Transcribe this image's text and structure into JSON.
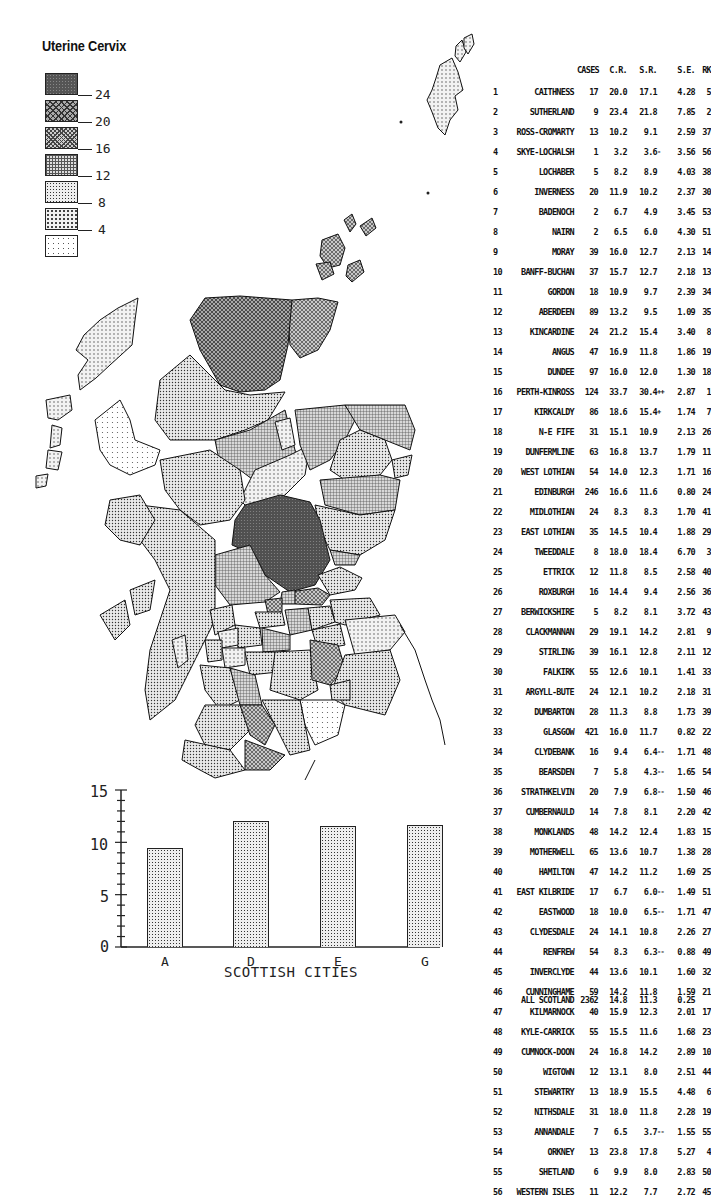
{
  "title": "Uterine Cervix",
  "legend": {
    "thresholds": [
      "24",
      "20",
      "16",
      "12",
      "8",
      "4"
    ],
    "classes": 7
  },
  "table": {
    "headers": {
      "cases": "CASES",
      "cr": "C.R.",
      "sr": "S.R.",
      "se": "S.E.",
      "rk": "RK"
    },
    "rows": [
      {
        "num": "1",
        "name": "CAITHNESS",
        "cases": "17",
        "cr": "20.0",
        "sr": "17.1",
        "flag": "",
        "se": "4.28",
        "rk": "5"
      },
      {
        "num": "2",
        "name": "SUTHERLAND",
        "cases": "9",
        "cr": "23.4",
        "sr": "21.8",
        "flag": "",
        "se": "7.85",
        "rk": "2"
      },
      {
        "num": "3",
        "name": "ROSS-CROMARTY",
        "cases": "13",
        "cr": "10.2",
        "sr": "9.1",
        "flag": "",
        "se": "2.59",
        "rk": "37"
      },
      {
        "num": "4",
        "name": "SKYE-LOCHALSH",
        "cases": "1",
        "cr": "3.2",
        "sr": "3.6",
        "flag": "-",
        "se": "3.56",
        "rk": "56"
      },
      {
        "num": "5",
        "name": "LOCHABER",
        "cases": "5",
        "cr": "8.2",
        "sr": "8.9",
        "flag": "",
        "se": "4.03",
        "rk": "38"
      },
      {
        "num": "6",
        "name": "INVERNESS",
        "cases": "20",
        "cr": "11.9",
        "sr": "10.2",
        "flag": "",
        "se": "2.37",
        "rk": "30"
      },
      {
        "num": "7",
        "name": "BADENOCH",
        "cases": "2",
        "cr": "6.7",
        "sr": "4.9",
        "flag": "",
        "se": "3.45",
        "rk": "53"
      },
      {
        "num": "8",
        "name": "NAIRN",
        "cases": "2",
        "cr": "6.5",
        "sr": "6.0",
        "flag": "",
        "se": "4.30",
        "rk": "51"
      },
      {
        "num": "9",
        "name": "MORAY",
        "cases": "39",
        "cr": "16.0",
        "sr": "12.7",
        "flag": "",
        "se": "2.13",
        "rk": "14"
      },
      {
        "num": "10",
        "name": "BANFF-BUCHAN",
        "cases": "37",
        "cr": "15.7",
        "sr": "12.7",
        "flag": "",
        "se": "2.18",
        "rk": "13"
      },
      {
        "num": "11",
        "name": "GORDON",
        "cases": "18",
        "cr": "10.9",
        "sr": "9.7",
        "flag": "",
        "se": "2.39",
        "rk": "34"
      },
      {
        "num": "12",
        "name": "ABERDEEN",
        "cases": "89",
        "cr": "13.2",
        "sr": "9.5",
        "flag": "",
        "se": "1.09",
        "rk": "35"
      },
      {
        "num": "13",
        "name": "KINCARDINE",
        "cases": "24",
        "cr": "21.2",
        "sr": "15.4",
        "flag": "",
        "se": "3.40",
        "rk": "8"
      },
      {
        "num": "14",
        "name": "ANGUS",
        "cases": "47",
        "cr": "16.9",
        "sr": "11.8",
        "flag": "",
        "se": "1.86",
        "rk": "19"
      },
      {
        "num": "15",
        "name": "DUNDEE",
        "cases": "97",
        "cr": "16.0",
        "sr": "12.0",
        "flag": "",
        "se": "1.30",
        "rk": "18"
      },
      {
        "num": "16",
        "name": "PERTH-KINROSS",
        "cases": "124",
        "cr": "33.7",
        "sr": "30.4",
        "flag": "++",
        "se": "2.87",
        "rk": "1"
      },
      {
        "num": "17",
        "name": "KIRKCALDY",
        "cases": "86",
        "cr": "18.6",
        "sr": "15.4",
        "flag": "+",
        "se": "1.74",
        "rk": "7"
      },
      {
        "num": "18",
        "name": "N-E FIFE",
        "cases": "31",
        "cr": "15.1",
        "sr": "10.9",
        "flag": "",
        "se": "2.13",
        "rk": "26"
      },
      {
        "num": "19",
        "name": "DUNFERMLINE",
        "cases": "63",
        "cr": "16.8",
        "sr": "13.7",
        "flag": "",
        "se": "1.79",
        "rk": "11"
      },
      {
        "num": "20",
        "name": "WEST LOTHIAN",
        "cases": "54",
        "cr": "14.0",
        "sr": "12.3",
        "flag": "",
        "se": "1.71",
        "rk": "16"
      },
      {
        "num": "21",
        "name": "EDINBURGH",
        "cases": "246",
        "cr": "16.6",
        "sr": "11.6",
        "flag": "",
        "se": "0.80",
        "rk": "24"
      },
      {
        "num": "22",
        "name": "MIDLOTHIAN",
        "cases": "24",
        "cr": "8.3",
        "sr": "8.3",
        "flag": "",
        "se": "1.70",
        "rk": "41"
      },
      {
        "num": "23",
        "name": "EAST LOTHIAN",
        "cases": "35",
        "cr": "14.5",
        "sr": "10.4",
        "flag": "",
        "se": "1.88",
        "rk": "29"
      },
      {
        "num": "24",
        "name": "TWEEDDALE",
        "cases": "8",
        "cr": "18.0",
        "sr": "18.4",
        "flag": "",
        "se": "6.70",
        "rk": "3"
      },
      {
        "num": "25",
        "name": "ETTRICK",
        "cases": "12",
        "cr": "11.8",
        "sr": "8.5",
        "flag": "",
        "se": "2.58",
        "rk": "40"
      },
      {
        "num": "26",
        "name": "ROXBURGH",
        "cases": "16",
        "cr": "14.4",
        "sr": "9.4",
        "flag": "",
        "se": "2.56",
        "rk": "36"
      },
      {
        "num": "27",
        "name": "BERWICKSHIRE",
        "cases": "5",
        "cr": "8.2",
        "sr": "8.1",
        "flag": "",
        "se": "3.72",
        "rk": "43"
      },
      {
        "num": "28",
        "name": "CLACKMANNAN",
        "cases": "29",
        "cr": "19.1",
        "sr": "14.2",
        "flag": "",
        "se": "2.81",
        "rk": "9"
      },
      {
        "num": "29",
        "name": "STIRLING",
        "cases": "39",
        "cr": "16.1",
        "sr": "12.8",
        "flag": "",
        "se": "2.11",
        "rk": "12"
      },
      {
        "num": "30",
        "name": "FALKIRK",
        "cases": "55",
        "cr": "12.6",
        "sr": "10.1",
        "flag": "",
        "se": "1.41",
        "rk": "33"
      },
      {
        "num": "31",
        "name": "ARGYLL-BUTE",
        "cases": "24",
        "cr": "12.1",
        "sr": "10.2",
        "flag": "",
        "se": "2.18",
        "rk": "31"
      },
      {
        "num": "32",
        "name": "DUMBARTON",
        "cases": "28",
        "cr": "11.3",
        "sr": "8.8",
        "flag": "",
        "se": "1.73",
        "rk": "39"
      },
      {
        "num": "33",
        "name": "GLASGOW",
        "cases": "421",
        "cr": "16.0",
        "sr": "11.7",
        "flag": "",
        "se": "0.82",
        "rk": "22"
      },
      {
        "num": "34",
        "name": "CLYDEBANK",
        "cases": "16",
        "cr": "9.4",
        "sr": "6.4",
        "flag": "--",
        "se": "1.71",
        "rk": "48"
      },
      {
        "num": "35",
        "name": "BEARSDEN",
        "cases": "7",
        "cr": "5.8",
        "sr": "4.3",
        "flag": "--",
        "se": "1.65",
        "rk": "54"
      },
      {
        "num": "36",
        "name": "STRATHKELVIN",
        "cases": "20",
        "cr": "7.9",
        "sr": "6.8",
        "flag": "--",
        "se": "1.50",
        "rk": "46"
      },
      {
        "num": "37",
        "name": "CUMBERNAULD",
        "cases": "14",
        "cr": "7.8",
        "sr": "8.1",
        "flag": "",
        "se": "2.20",
        "rk": "42"
      },
      {
        "num": "38",
        "name": "MONKLANDS",
        "cases": "48",
        "cr": "14.2",
        "sr": "12.4",
        "flag": "",
        "se": "1.83",
        "rk": "15"
      },
      {
        "num": "39",
        "name": "MOTHERWELL",
        "cases": "65",
        "cr": "13.6",
        "sr": "10.7",
        "flag": "",
        "se": "1.38",
        "rk": "28"
      },
      {
        "num": "40",
        "name": "HAMILTON",
        "cases": "47",
        "cr": "14.2",
        "sr": "11.2",
        "flag": "",
        "se": "1.69",
        "rk": "25"
      },
      {
        "num": "41",
        "name": "EAST KILBRIDE",
        "cases": "17",
        "cr": "6.7",
        "sr": "6.0",
        "flag": "--",
        "se": "1.49",
        "rk": "51"
      },
      {
        "num": "42",
        "name": "EASTWOOD",
        "cases": "18",
        "cr": "10.0",
        "sr": "6.5",
        "flag": "--",
        "se": "1.71",
        "rk": "47"
      },
      {
        "num": "43",
        "name": "CLYDESDALE",
        "cases": "24",
        "cr": "14.1",
        "sr": "10.8",
        "flag": "",
        "se": "2.26",
        "rk": "27"
      },
      {
        "num": "44",
        "name": "RENFREW",
        "cases": "54",
        "cr": "8.3",
        "sr": "6.3",
        "flag": "--",
        "se": "0.88",
        "rk": "49"
      },
      {
        "num": "45",
        "name": "INVERCLYDE",
        "cases": "44",
        "cr": "13.6",
        "sr": "10.1",
        "flag": "",
        "se": "1.60",
        "rk": "32"
      },
      {
        "num": "46",
        "name": "CUNNINGHAME",
        "cases": "59",
        "cr": "14.2",
        "sr": "11.8",
        "flag": "",
        "se": "1.59",
        "rk": "21"
      },
      {
        "num": "47",
        "name": "KILMARNOCK",
        "cases": "40",
        "cr": "15.9",
        "sr": "12.3",
        "flag": "",
        "se": "2.01",
        "rk": "17"
      },
      {
        "num": "48",
        "name": "KYLE-CARRICK",
        "cases": "55",
        "cr": "15.5",
        "sr": "11.6",
        "flag": "",
        "se": "1.68",
        "rk": "23"
      },
      {
        "num": "49",
        "name": "CUMNOCK-DOON",
        "cases": "24",
        "cr": "16.8",
        "sr": "14.2",
        "flag": "",
        "se": "2.89",
        "rk": "10"
      },
      {
        "num": "50",
        "name": "WIGTOWN",
        "cases": "12",
        "cr": "13.1",
        "sr": "8.0",
        "flag": "",
        "se": "2.51",
        "rk": "44"
      },
      {
        "num": "51",
        "name": "STEWARTRY",
        "cases": "13",
        "cr": "18.9",
        "sr": "15.5",
        "flag": "",
        "se": "4.48",
        "rk": "6"
      },
      {
        "num": "52",
        "name": "NITHSDALE",
        "cases": "31",
        "cr": "18.0",
        "sr": "11.8",
        "flag": "",
        "se": "2.28",
        "rk": "19"
      },
      {
        "num": "53",
        "name": "ANNANDALE",
        "cases": "7",
        "cr": "6.5",
        "sr": "3.7",
        "flag": "--",
        "se": "1.55",
        "rk": "55"
      },
      {
        "num": "54",
        "name": "ORKNEY",
        "cases": "13",
        "cr": "23.8",
        "sr": "17.8",
        "flag": "",
        "se": "5.27",
        "rk": "4"
      },
      {
        "num": "55",
        "name": "SHETLAND",
        "cases": "6",
        "cr": "9.9",
        "sr": "8.0",
        "flag": "",
        "se": "2.83",
        "rk": "50"
      },
      {
        "num": "56",
        "name": "WESTERN ISLES",
        "cases": "11",
        "cr": "12.2",
        "sr": "7.7",
        "flag": "",
        "se": "2.72",
        "rk": "45"
      }
    ],
    "total": {
      "name": "ALL SCOTLAND",
      "cases": "2362",
      "cr": "14.8",
      "sr": "11.3",
      "se": "0.25"
    }
  },
  "chart_data": [
    {
      "type": "bar",
      "title": "",
      "categories": [
        "A",
        "D",
        "E",
        "G"
      ],
      "values": [
        9.5,
        12.0,
        11.6,
        11.7
      ],
      "xlabel": "SCOTTISH CITIES",
      "ylabel": "",
      "ylim": [
        0,
        15
      ],
      "yticks": [
        "0",
        "5",
        "10",
        "15"
      ],
      "grid": false
    },
    {
      "type": "table",
      "title": "Uterine Cervix",
      "columns": [
        "#",
        "District",
        "CASES",
        "C.R.",
        "S.R.",
        "S.E.",
        "RK"
      ],
      "legend": [
        "<4",
        "4-8",
        "8-12",
        "12-16",
        "16-20",
        "20-24",
        ">24"
      ]
    }
  ]
}
